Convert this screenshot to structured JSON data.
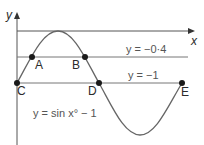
{
  "diagram": {
    "axes": {
      "x_label": "x",
      "y_label": "y"
    },
    "curve": {
      "equation": "y = sin x° − 1",
      "label": "y = sin x° − 1"
    },
    "lines": [
      {
        "id": "line_minus_0_4",
        "equation": "y = −0·4",
        "label": "y = −0·4"
      },
      {
        "id": "line_minus_1",
        "equation": "y = −1",
        "label": "y = −1"
      }
    ],
    "points": [
      {
        "label": "A",
        "on": "y = −0·4"
      },
      {
        "label": "B",
        "on": "y = −0·4"
      },
      {
        "label": "C",
        "on": "y = −1"
      },
      {
        "label": "D",
        "on": "y = −1"
      },
      {
        "label": "E",
        "on": "y = −1"
      }
    ],
    "colors": {
      "axis": "#555555",
      "curve": "#666666",
      "lines": "#777777",
      "points": "#1a1a1a",
      "text": "#2b2b2b"
    }
  }
}
